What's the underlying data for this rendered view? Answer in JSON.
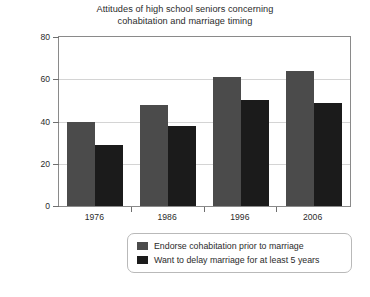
{
  "chart_data": {
    "type": "bar",
    "title": "Attitudes of high school seniors concerning cohabitation and marriage timing",
    "title_lines": [
      "Attitudes of high school seniors concerning",
      "cohabitation and marriage timing"
    ],
    "xlabel": "",
    "ylabel": "Percentage",
    "categories": [
      "1976",
      "1986",
      "1996",
      "2006"
    ],
    "ylim": [
      0,
      80
    ],
    "yticks": [
      0,
      20,
      40,
      60,
      80
    ],
    "ytick_labels": [
      "0",
      "20",
      "40",
      "60",
      "80"
    ],
    "grid": true,
    "grid_axis": "y",
    "legend_position": "below-plot",
    "series": [
      {
        "name": "Endorse cohabitation prior to marriage",
        "color": "#4b4b4b",
        "values": [
          40,
          48,
          61,
          64
        ]
      },
      {
        "name": "Want to delay marriage for at least 5 years",
        "color": "#1b1b1b",
        "values": [
          29,
          38,
          50,
          49
        ]
      }
    ]
  }
}
